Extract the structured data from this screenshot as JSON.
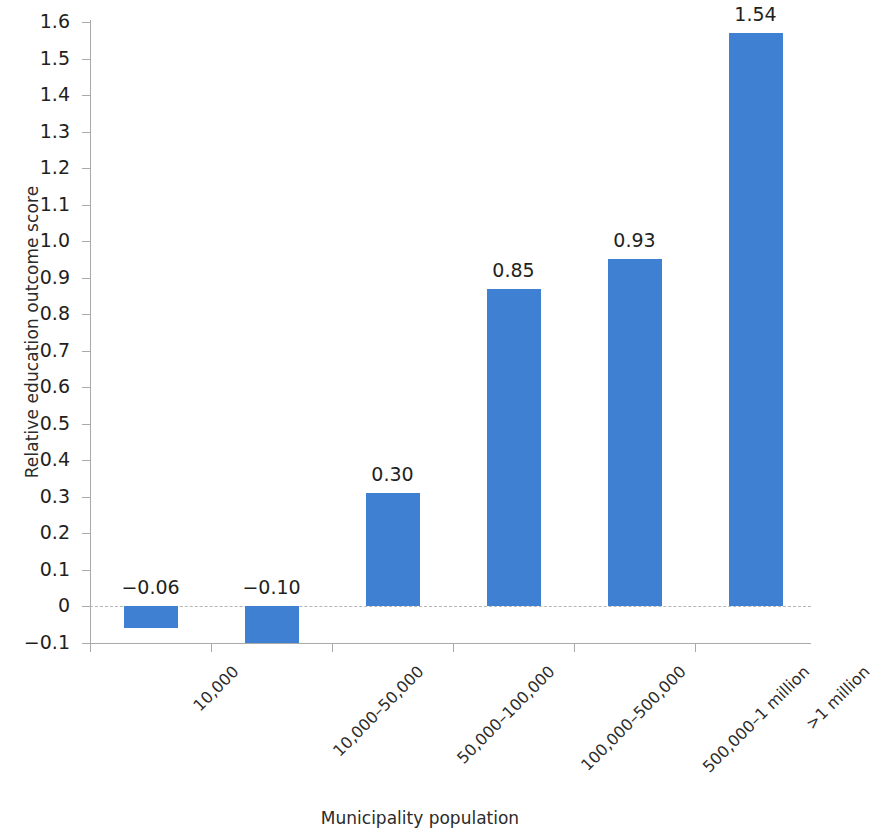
{
  "chart_data": {
    "type": "bar",
    "title": "",
    "subtitle": "",
    "xlabel": "Municipality population",
    "ylabel": "Relative education outcome score",
    "categories": [
      "10,000",
      "10,000–50,000",
      "50,000–100,000",
      "100,000–500,000",
      "500,000–1 million",
      ">1 million"
    ],
    "values": [
      -0.06,
      -0.1,
      0.3,
      0.85,
      0.93,
      1.54
    ],
    "value_labels": [
      "−0.06",
      "−0.10",
      "0.30",
      "0.85",
      "0.93",
      "1.54"
    ],
    "plotted_heights": [
      -0.06,
      -0.1,
      0.31,
      0.87,
      0.95,
      1.57
    ],
    "ylim": [
      -0.1,
      1.6
    ],
    "ytick_values": [
      1.6,
      1.5,
      1.4,
      1.3,
      1.2,
      1.1,
      1.0,
      0.9,
      0.8,
      0.7,
      0.6,
      0.5,
      0.4,
      0.3,
      0.2,
      0.1,
      0,
      -0.1
    ],
    "ytick_labels": [
      "1.6",
      "1.5",
      "1.4",
      "1.3",
      "1.2",
      "1.1",
      "1.0",
      "0.9",
      "0.8",
      "0.7",
      "0.6",
      "0.5",
      "0.4",
      "0.3",
      "0.2",
      "0.1",
      "0",
      "−0.1"
    ],
    "grid": false,
    "legend": null,
    "legend_position": "none",
    "zero_line": true,
    "bar_color": "#3f80d2",
    "axis_color": "#a9a9a9",
    "zero_line_color": "#b6b6b6",
    "text_color": "#231f20",
    "background": "#ffffff"
  }
}
